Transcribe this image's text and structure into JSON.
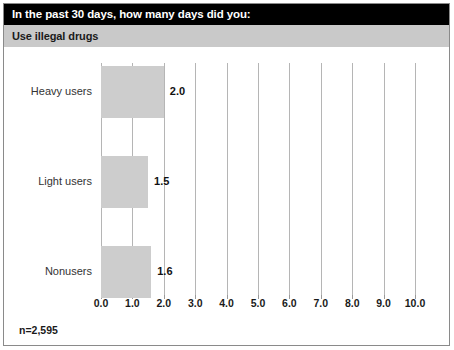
{
  "header": {
    "title_prefix": "In the past 30 days, how many ",
    "title_emphasis": "days",
    "title_suffix": " did you:",
    "subtitle": "Use illegal drugs"
  },
  "footnote": "n=2,595",
  "colors": {
    "title_bar_bg": "#000000",
    "subtitle_bar_bg": "#c9c9c9",
    "bar_fill": "#cdcdcd",
    "gridline": "#b5b5b5",
    "border": "#8a8a8a"
  },
  "chart_data": {
    "type": "bar",
    "orientation": "horizontal",
    "title": "In the past 30 days, how many days did you:",
    "subtitle": "Use illegal drugs",
    "categories": [
      "Heavy users",
      "Light users",
      "Nonusers"
    ],
    "values": [
      2.0,
      1.5,
      1.6
    ],
    "value_labels": [
      "2.0",
      "1.5",
      "1.6"
    ],
    "xlabel": "",
    "ylabel": "",
    "xlim": [
      0.0,
      10.0
    ],
    "xticks": [
      0.0,
      1.0,
      2.0,
      3.0,
      4.0,
      5.0,
      6.0,
      7.0,
      8.0,
      9.0,
      10.0
    ],
    "xtick_labels": [
      "0.0",
      "1.0",
      "2.0",
      "3.0",
      "4.0",
      "5.0",
      "6.0",
      "7.0",
      "8.0",
      "9.0",
      "10.0"
    ],
    "grid": true,
    "grid_axis": "x",
    "legend": false,
    "annotation": "n=2,595"
  }
}
